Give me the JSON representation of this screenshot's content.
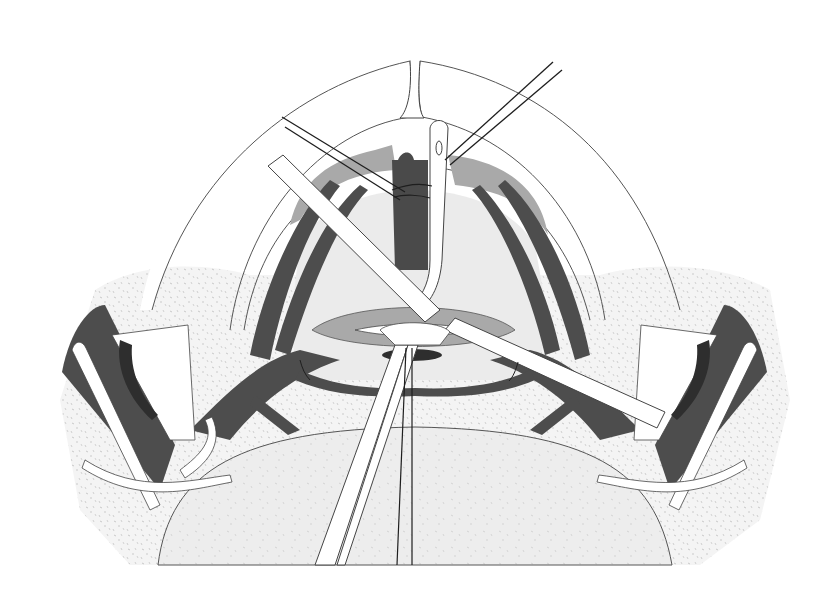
{
  "figure": {
    "kind": "surgical-illustration",
    "style": "grayscale line drawing with stippled tissue",
    "visible_text": [],
    "colors": {
      "background": "#ffffff",
      "stipple_tissue": "#f2f2f2",
      "stipple_dot": "#c4c4c4",
      "dark_muscle": "#4d4d4d",
      "darker_shadow": "#2e2e2e",
      "mid_tissue": "#a9a9a9",
      "light_field": "#e9e9e9",
      "outline": "#3a3a3a",
      "suture": "#1e1e1e",
      "instrument_fill": "#ffffff"
    },
    "elements": [
      "outer-arc-ring",
      "inner-arc-ring",
      "upper-central-retractor-blade",
      "left-diagonal-retractor-bar",
      "right-diagonal-retractor-bar",
      "central-vertical-instrument",
      "suture-pair-upper-left",
      "suture-pair-upper-right",
      "central-dark-vessel",
      "gray-tissue-flaps",
      "lens-shaped-incision",
      "lower-forceps",
      "lower-suture-threads",
      "left-lateral-retractor",
      "right-lateral-retractor",
      "lower-stippled-mound",
      "side-stippled-tissue"
    ]
  }
}
